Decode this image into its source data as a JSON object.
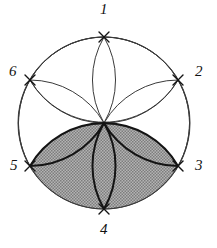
{
  "figure": {
    "name": "hexagonal-rosette-diagram",
    "type": "geometric-construction",
    "background_color": "#ffffff",
    "line_color": "#3a3a3a",
    "bold_line_color": "#141414",
    "fill_color": "#9c9c9c",
    "label_color": "#111111"
  },
  "circle": {
    "center_x": 104,
    "center_y": 123,
    "radius": 86
  },
  "vertices": [
    {
      "id": "1",
      "label": "1",
      "angle_deg": -90,
      "x": 104,
      "y": 37,
      "label_x": 100,
      "label_y": 2,
      "marker": "x-marker"
    },
    {
      "id": "2",
      "label": "2",
      "angle_deg": -30,
      "x": 178,
      "y": 80,
      "label_x": 193,
      "label_y": 66,
      "marker": "x-marker"
    },
    {
      "id": "3",
      "label": "3",
      "angle_deg": 30,
      "x": 178,
      "y": 166,
      "label_x": 193,
      "label_y": 166,
      "marker": "x-marker"
    },
    {
      "id": "4",
      "label": "4",
      "angle_deg": 90,
      "x": 104,
      "y": 209,
      "label_x": 100,
      "label_y": 224,
      "marker": "x-marker"
    },
    {
      "id": "5",
      "label": "5",
      "angle_deg": 150,
      "x": 30,
      "y": 166,
      "label_x": 12,
      "label_y": 166,
      "marker": "x-marker"
    },
    {
      "id": "6",
      "label": "6",
      "angle_deg": -150,
      "x": 30,
      "y": 80,
      "label_x": 11,
      "label_y": 66,
      "marker": "x-marker"
    }
  ],
  "petals": [
    {
      "id": "petal-1",
      "to_vertex": "1",
      "shaded": false,
      "bold": false
    },
    {
      "id": "petal-2",
      "to_vertex": "2",
      "shaded": false,
      "bold": false
    },
    {
      "id": "petal-3",
      "to_vertex": "3",
      "shaded": true,
      "bold": true
    },
    {
      "id": "petal-4",
      "to_vertex": "4",
      "shaded": true,
      "bold": true
    },
    {
      "id": "petal-5",
      "to_vertex": "5",
      "shaded": true,
      "bold": true
    },
    {
      "id": "petal-6",
      "to_vertex": "6",
      "shaded": false,
      "bold": false
    }
  ],
  "shaded_region": {
    "id": "shaded-lower-rosette",
    "description": "lower three petals filled with gray crosshatch",
    "fill": "#9c9c9c"
  }
}
